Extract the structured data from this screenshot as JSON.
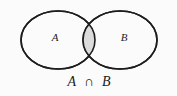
{
  "figure": {
    "kind": "venn-diagram",
    "background_color": "#fbfbfb",
    "stroke_color": "#1d1d1d",
    "stroke_width": 1.6,
    "intersection_fill": "#dcdcdc",
    "set_fill": "#fbfbfb",
    "text_color": "#1d1d1d",
    "sets": [
      {
        "id": "set-a",
        "label": "A",
        "label_x": 55,
        "label_y": 38,
        "cx": 58,
        "cy": 40,
        "rx": 37,
        "ry": 29
      },
      {
        "id": "set-b",
        "label": "B",
        "label_x": 124,
        "label_y": 38,
        "cx": 120,
        "cy": 40,
        "rx": 37,
        "ry": 29
      }
    ],
    "region": {
      "id": "intersection-region",
      "description": "A intersect B",
      "shaded": true
    },
    "caption": {
      "left_operand": "A",
      "operator": "∩",
      "right_operand": "B",
      "full_text": "A ∩ B",
      "x": 89,
      "y": 86
    }
  }
}
